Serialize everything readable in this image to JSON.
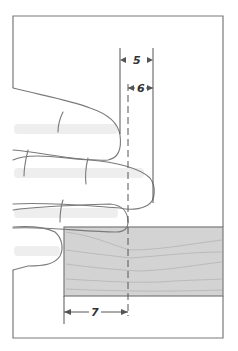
{
  "diagram": {
    "type": "technical-illustration",
    "colors": {
      "background": "#ffffff",
      "outline": "#7a7a7a",
      "board_fill": "#d3d3d3",
      "grain": "#b4b4b4",
      "text": "#333333",
      "hand_shadow": "#ececec"
    },
    "outer_frame": {
      "x": 13,
      "y": 16,
      "width": 210,
      "height": 322
    },
    "board": {
      "x": 64,
      "y": 227,
      "width": 159,
      "height": 69
    },
    "reference_lines": {
      "left_dimension_line_x": 120,
      "dashed_center_line_x": 128,
      "right_dimension_line_x": 153
    },
    "dimensions": [
      {
        "id": "5",
        "label": "5",
        "from_x": 120,
        "to_x": 153,
        "y": 60
      },
      {
        "id": "6",
        "label": "6",
        "from_x": 128,
        "to_x": 153,
        "y": 88
      },
      {
        "id": "7",
        "label": "7",
        "from_x": 64,
        "to_x": 128,
        "y": 312
      }
    ]
  }
}
